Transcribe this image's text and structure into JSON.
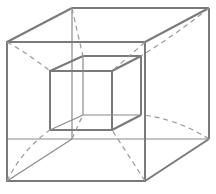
{
  "diagram": {
    "stroke_color": "#7a7a7a",
    "dash_color": "#9a9a9a",
    "background": "#ffffff",
    "outer_cube": {
      "front": [
        [
          7,
          42
        ],
        [
          145,
          42
        ],
        [
          145,
          181
        ],
        [
          7,
          181
        ]
      ],
      "back": [
        [
          72,
          8
        ],
        [
          209,
          8
        ],
        [
          209,
          139
        ],
        [
          72,
          139
        ]
      ]
    },
    "inner_cube": {
      "front": [
        [
          50,
          71
        ],
        [
          112,
          71
        ],
        [
          112,
          130
        ],
        [
          50,
          130
        ]
      ],
      "back": [
        [
          83,
          56
        ],
        [
          141,
          56
        ],
        [
          141,
          115
        ],
        [
          83,
          115
        ]
      ]
    }
  }
}
